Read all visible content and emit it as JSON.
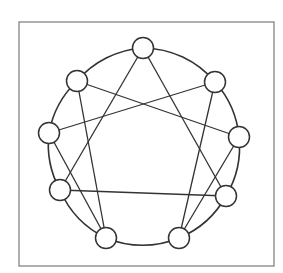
{
  "diagram": {
    "type": "enneagram",
    "frame": {
      "x": 19,
      "y": 22,
      "width": 255,
      "height": 244,
      "stroke": "#7a7a7a"
    },
    "circle": {
      "cx": 143,
      "cy": 143,
      "r": 95,
      "stroke": "#333333"
    },
    "node_radius": 10.5,
    "line_color": "#333333",
    "nodes": [
      {
        "id": "9",
        "position": "top",
        "x": 143,
        "y": 48
      },
      {
        "id": "1",
        "position": "upper-right",
        "x": 215,
        "y": 82
      },
      {
        "id": "2",
        "position": "right",
        "x": 239,
        "y": 137
      },
      {
        "id": "3",
        "position": "lower-right",
        "x": 226,
        "y": 196
      },
      {
        "id": "4",
        "position": "bottom-right",
        "x": 179,
        "y": 238
      },
      {
        "id": "5",
        "position": "bottom-left",
        "x": 106,
        "y": 238
      },
      {
        "id": "6",
        "position": "lower-left",
        "x": 60,
        "y": 190
      },
      {
        "id": "7",
        "position": "left",
        "x": 49,
        "y": 133
      },
      {
        "id": "8",
        "position": "upper-left",
        "x": 77,
        "y": 81
      }
    ],
    "edges": [
      [
        "1",
        "4"
      ],
      [
        "4",
        "2"
      ],
      [
        "2",
        "8"
      ],
      [
        "8",
        "5"
      ],
      [
        "5",
        "7"
      ],
      [
        "7",
        "1"
      ],
      [
        "3",
        "6"
      ],
      [
        "6",
        "9"
      ],
      [
        "9",
        "3"
      ]
    ]
  }
}
